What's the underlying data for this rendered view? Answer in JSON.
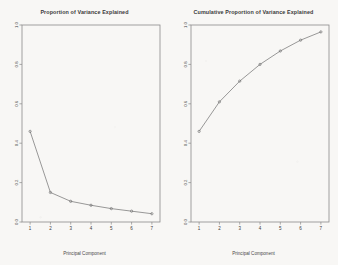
{
  "figure": {
    "background_color": "#f8f7f5",
    "frame_color": "#8a8a8a",
    "line_color": "#6e6e6e",
    "text_color": "#3a3a3a"
  },
  "chart_data": [
    {
      "type": "line",
      "title": "Proportion of Variance Explained",
      "xlabel": "Principal Component",
      "ylabel": "",
      "x": [
        1,
        2,
        3,
        4,
        5,
        6,
        7
      ],
      "categories": [
        "1",
        "2",
        "3",
        "4",
        "5",
        "6",
        "7"
      ],
      "values": [
        0.46,
        0.15,
        0.105,
        0.085,
        0.068,
        0.055,
        0.042
      ],
      "xlim": [
        0.6,
        7.4
      ],
      "ylim": [
        0.0,
        1.0
      ],
      "xticks": [
        "1",
        "2",
        "3",
        "4",
        "5",
        "6",
        "7"
      ],
      "yticks": [
        "0.0",
        "0.2",
        "0.4",
        "0.6",
        "0.8",
        "1.0"
      ],
      "ytick_values": [
        0.0,
        0.2,
        0.4,
        0.6,
        0.8,
        1.0
      ],
      "grid": false,
      "legend": "none",
      "marker": "circle",
      "panel": "left"
    },
    {
      "type": "line",
      "title": "Cumulative Proportion of Variance Explained",
      "xlabel": "Principal Component",
      "ylabel": "",
      "x": [
        1,
        2,
        3,
        4,
        5,
        6,
        7
      ],
      "categories": [
        "1",
        "2",
        "3",
        "4",
        "5",
        "6",
        "7"
      ],
      "values": [
        0.46,
        0.61,
        0.715,
        0.8,
        0.868,
        0.923,
        0.965
      ],
      "xlim": [
        0.6,
        7.4
      ],
      "ylim": [
        0.0,
        1.0
      ],
      "xticks": [
        "1",
        "2",
        "3",
        "4",
        "5",
        "6",
        "7"
      ],
      "yticks": [
        "0.0",
        "0.2",
        "0.4",
        "0.6",
        "0.8",
        "1.0"
      ],
      "ytick_values": [
        0.0,
        0.2,
        0.4,
        0.6,
        0.8,
        1.0
      ],
      "grid": false,
      "legend": "none",
      "marker": "circle",
      "panel": "right"
    }
  ]
}
